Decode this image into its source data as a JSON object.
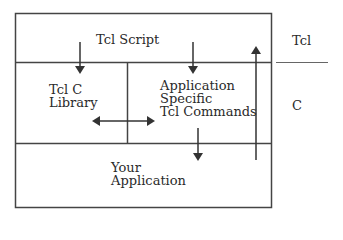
{
  "diagram": {
    "colors": {
      "line": "#444444",
      "text": "#2a2a2a",
      "background": "#ffffff"
    },
    "boxes": {
      "tcl_script": {
        "label": "Tcl Script"
      },
      "tcl_c_library": {
        "line1": "Tcl C",
        "line2": "Library"
      },
      "app_specific": {
        "line1": "Application",
        "line2": "Specific",
        "line3": "Tcl Commands"
      },
      "your_application": {
        "line1": "Your",
        "line2": "Application"
      }
    },
    "layers": {
      "top": "Tcl",
      "bottom": "C"
    },
    "arrows": [
      {
        "from": "tcl_script",
        "to": "tcl_c_library",
        "direction": "down"
      },
      {
        "from": "tcl_script",
        "to": "app_specific",
        "direction": "down"
      },
      {
        "from": "tcl_c_library",
        "to": "app_specific",
        "direction": "bidirectional"
      },
      {
        "from": "app_specific",
        "to": "your_application",
        "direction": "down"
      },
      {
        "from": "your_application",
        "to": "tcl_script",
        "direction": "up"
      }
    ]
  }
}
